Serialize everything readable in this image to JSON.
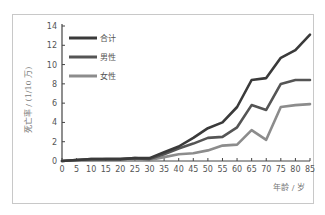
{
  "chart_data": {
    "type": "line",
    "title": "",
    "xlabel": "年龄 / 岁",
    "ylabel": "死亡率 / (1/10 万)",
    "x": [
      0,
      5,
      10,
      15,
      20,
      25,
      30,
      35,
      40,
      45,
      50,
      55,
      60,
      65,
      70,
      75,
      80,
      85
    ],
    "xlim": [
      0,
      85
    ],
    "ylim": [
      0,
      14
    ],
    "xticks": [
      0,
      5,
      10,
      15,
      20,
      25,
      30,
      35,
      40,
      45,
      50,
      55,
      60,
      65,
      70,
      75,
      80,
      85
    ],
    "yticks": [
      0,
      2,
      4,
      6,
      8,
      10,
      12,
      14
    ],
    "grid": false,
    "legend_position": "upper-left",
    "series": [
      {
        "name": "合计",
        "color": "#3a3a3a",
        "values": [
          0.0,
          0.1,
          0.2,
          0.2,
          0.2,
          0.3,
          0.3,
          0.9,
          1.5,
          2.4,
          3.4,
          4.0,
          5.6,
          8.4,
          8.6,
          10.7,
          11.5,
          13.1
        ]
      },
      {
        "name": "男性",
        "color": "#555555",
        "values": [
          0.0,
          0.1,
          0.2,
          0.2,
          0.2,
          0.3,
          0.2,
          0.7,
          1.3,
          1.8,
          2.4,
          2.5,
          3.5,
          5.8,
          5.3,
          8.0,
          8.4,
          8.4
        ]
      },
      {
        "name": "女性",
        "color": "#8c8c8c",
        "values": [
          0.0,
          0.1,
          0.1,
          0.2,
          0.2,
          0.2,
          0.1,
          0.4,
          0.7,
          0.8,
          1.1,
          1.6,
          1.7,
          3.2,
          2.2,
          5.6,
          5.8,
          5.9
        ]
      }
    ]
  }
}
